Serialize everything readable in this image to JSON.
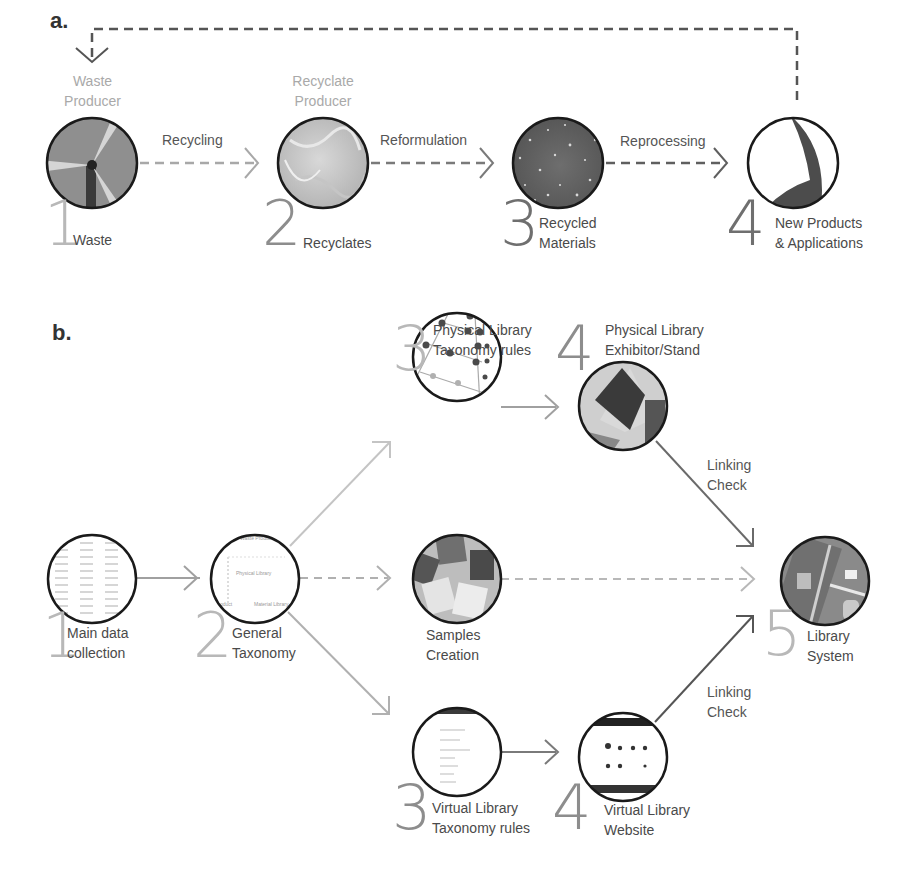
{
  "panel_a": {
    "label": "a.",
    "nodes": [
      {
        "number": "1",
        "role": "Waste Producer",
        "role_line1": "Waste",
        "role_line2": "Producer",
        "name": "Waste",
        "image": "wind-turbine"
      },
      {
        "number": "2",
        "role": "Recyclate Producer",
        "role_line1": "Recyclate",
        "role_line2": "Producer",
        "name": "Recyclates",
        "image": "shredded-fibre"
      },
      {
        "number": "3",
        "role": "",
        "name_line1": "Recycled",
        "name_line2": "Materials",
        "image": "speckled-composite"
      },
      {
        "number": "4",
        "role": "",
        "name_line1": "New Products",
        "name_line2": "& Applications",
        "image": "curved-product"
      }
    ],
    "edges": [
      {
        "from": "1",
        "to": "2",
        "label": "Recycling",
        "style": "dashed"
      },
      {
        "from": "2",
        "to": "3",
        "label": "Reformulation",
        "style": "dashed"
      },
      {
        "from": "3",
        "to": "4",
        "label": "Reprocessing",
        "style": "dashed"
      },
      {
        "from": "4",
        "to": "1",
        "label": "",
        "style": "dashed-loop"
      }
    ]
  },
  "panel_b": {
    "label": "b.",
    "nodes": [
      {
        "id": "main",
        "number": "1",
        "line1": "Main data",
        "line2": "collection",
        "image": "data-table"
      },
      {
        "id": "general",
        "number": "2",
        "line1": "General",
        "line2": "Taxonomy",
        "image": "taxonomy-chart",
        "inner_text": [
          "Waste Producer",
          "Physical Library",
          "Product",
          "Material Library"
        ]
      },
      {
        "id": "phys-tax",
        "number": "3",
        "line1": "Physical Library",
        "line2": "Taxonomy rules",
        "image": "network-dots"
      },
      {
        "id": "phys-stand",
        "number": "4",
        "line1": "Physical Library",
        "line2": "Exhibitor/Stand",
        "image": "pyramid-stand"
      },
      {
        "id": "samples",
        "number": "",
        "line1": "Samples",
        "line2": "Creation",
        "image": "material-samples"
      },
      {
        "id": "virt-tax",
        "number": "3",
        "line1": "Virtual Library",
        "line2": "Taxonomy rules",
        "image": "web-list"
      },
      {
        "id": "virt-web",
        "number": "4",
        "line1": "Virtual Library",
        "line2": "Website",
        "image": "website-grid"
      },
      {
        "id": "system",
        "number": "5",
        "line1": "Library",
        "line2": "System",
        "image": "phone-app"
      }
    ],
    "edges": [
      {
        "from": "main",
        "to": "general",
        "label": "",
        "style": "solid"
      },
      {
        "from": "general",
        "to": "phys-tax",
        "label": "",
        "style": "solid-light"
      },
      {
        "from": "general",
        "to": "samples",
        "label": "",
        "style": "dashed"
      },
      {
        "from": "general",
        "to": "virt-tax",
        "label": "",
        "style": "solid-light"
      },
      {
        "from": "phys-tax",
        "to": "phys-stand",
        "label": "",
        "style": "solid"
      },
      {
        "from": "virt-tax",
        "to": "virt-web",
        "label": "",
        "style": "solid"
      },
      {
        "from": "phys-stand",
        "to": "system",
        "label_line1": "Linking",
        "label_line2": "Check",
        "style": "solid-dark"
      },
      {
        "from": "samples",
        "to": "system",
        "label": "",
        "style": "dashed"
      },
      {
        "from": "virt-web",
        "to": "system",
        "label_line1": "Linking",
        "label_line2": "Check",
        "style": "solid-dark"
      }
    ]
  },
  "colors": {
    "circle_stroke": "#1a1a1a",
    "arrow_light": "#bdbdbd",
    "arrow_mid": "#9a9a9a",
    "arrow_dark": "#6a6a6a",
    "number_light": "#b8b8b8",
    "number_dark": "#6f6f6f",
    "text": "#555555"
  }
}
